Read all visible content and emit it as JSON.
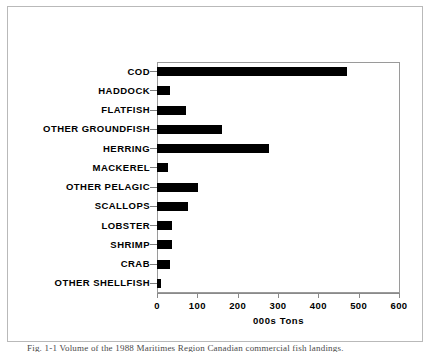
{
  "figure": {
    "caption": "Fig. 1-1  Volume of the 1988 Maritimes Region Canadian commercial fish landings."
  },
  "chart_data": {
    "type": "bar",
    "orientation": "horizontal",
    "title": "",
    "subtitle": "",
    "xlabel": "000s Tons",
    "ylabel": "",
    "xlim": [
      0,
      600
    ],
    "xticks": [
      0,
      100,
      200,
      300,
      400,
      500,
      600
    ],
    "xtick_labels": [
      "0",
      "100",
      "200",
      "300",
      "400",
      "500",
      "600"
    ],
    "grid": false,
    "legend": null,
    "bar_color": "#000000",
    "categories": [
      "COD",
      "HADDOCK",
      "FLATFISH",
      "OTHER GROUNDFISH",
      "HERRING",
      "MACKEREL",
      "OTHER PELAGIC",
      "SCALLOPS",
      "LOBSTER",
      "SHRIMP",
      "CRAB",
      "OTHER SHELLFISH"
    ],
    "values": [
      471,
      32,
      72,
      160,
      277,
      27,
      101,
      77,
      38,
      36,
      31,
      11
    ],
    "units": "000s Tons"
  }
}
